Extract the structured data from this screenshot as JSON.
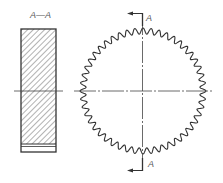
{
  "diagram": {
    "type": "technical-drawing",
    "section_label": "A—A",
    "cut_plane_letter_top": "A",
    "cut_plane_letter_bottom": "A",
    "colors": {
      "line": "#333333",
      "hatch": "#555555",
      "label": "#555555",
      "background": "#ffffff"
    },
    "section_view": {
      "x": 21,
      "y": 29,
      "width": 35,
      "height": 123,
      "hatch_bottom": 144,
      "band_line_y": 146
    },
    "front_view": {
      "cx": 143,
      "cy": 91,
      "outer_radius": 63,
      "tooth_amplitude": 3,
      "tooth_count": 48
    }
  }
}
